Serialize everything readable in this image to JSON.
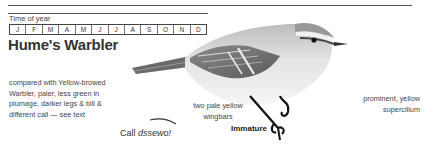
{
  "time_of_year": {
    "label": "Time of year",
    "months": [
      "J",
      "F",
      "M",
      "A",
      "M",
      "J",
      "J",
      "A",
      "S",
      "O",
      "N",
      "D"
    ]
  },
  "species": {
    "title": "Hume's Warbler"
  },
  "annotations": {
    "comparison": "compared with Yellow-browed Warbler, paler, less green in plumage, darker legs & bill & different call — see text",
    "wingbars": "two pale yellow wingbars",
    "supercilium": "prominent, yellow supercilium",
    "age_caption": "Immature"
  },
  "call": {
    "prefix": "Call",
    "sound": "dssewo!"
  },
  "illustration": {
    "icon": "warbler-bird-illustration"
  }
}
